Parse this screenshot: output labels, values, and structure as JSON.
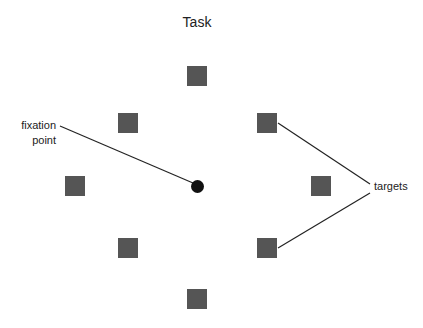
{
  "title": "Task",
  "labels": {
    "fixation_line1": "fixation",
    "fixation_line2": "point",
    "targets": "targets"
  },
  "colors": {
    "target": "#555555",
    "fixation": "#111111",
    "line": "#222222"
  },
  "targets": [
    {
      "id": "top",
      "x": 187,
      "y": 66
    },
    {
      "id": "upper-left",
      "x": 118,
      "y": 113
    },
    {
      "id": "upper-right",
      "x": 257,
      "y": 113
    },
    {
      "id": "left",
      "x": 65,
      "y": 176
    },
    {
      "id": "right",
      "x": 311,
      "y": 176
    },
    {
      "id": "lower-left",
      "x": 118,
      "y": 238
    },
    {
      "id": "lower-right",
      "x": 257,
      "y": 238
    },
    {
      "id": "bottom",
      "x": 187,
      "y": 289
    }
  ],
  "fixation": {
    "cx": 197,
    "cy": 186
  }
}
